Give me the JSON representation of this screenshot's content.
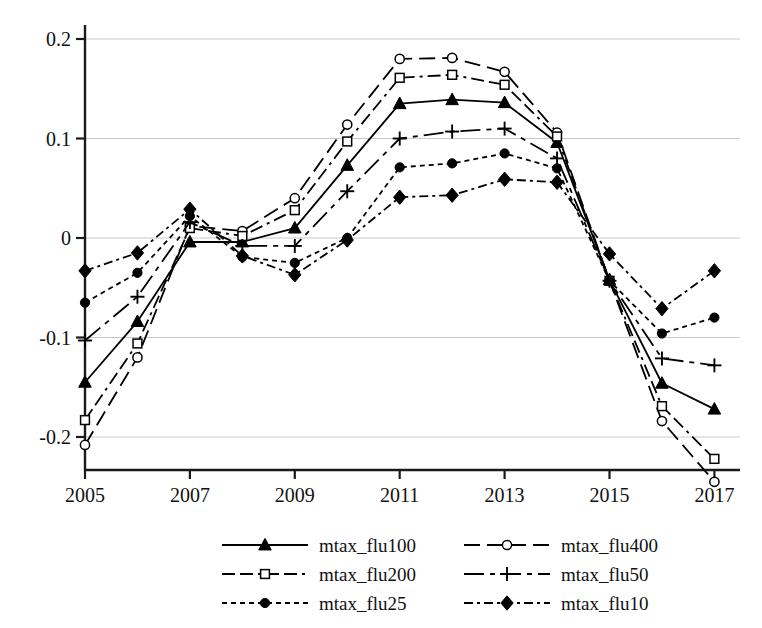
{
  "chart_data": {
    "type": "line",
    "title": "",
    "subtitle": "",
    "xlabel": "",
    "ylabel": "",
    "x": [
      2005,
      2006,
      2007,
      2008,
      2009,
      2010,
      2011,
      2012,
      2013,
      2014,
      2015,
      2016,
      2017
    ],
    "xtick_labels": [
      "2005",
      "2007",
      "2009",
      "2011",
      "2013",
      "2015",
      "2017"
    ],
    "xtick_values": [
      2005,
      2007,
      2009,
      2011,
      2013,
      2015,
      2017
    ],
    "ytick_labels": [
      "0.2",
      "0.1",
      "0",
      "-0.1",
      "-0.2"
    ],
    "ytick_values": [
      0.2,
      0.1,
      0,
      -0.1,
      -0.2
    ],
    "xlim": [
      2004.6,
      2017.4
    ],
    "ylim": [
      -0.258,
      0.212
    ],
    "grid": "horizontal",
    "legend_position": "bottom",
    "series": [
      {
        "name": "mtax_flu100",
        "marker": "triangle-filled",
        "dash": "solid",
        "color": "#000000",
        "values": [
          -0.145,
          -0.084,
          -0.004,
          -0.004,
          0.01,
          0.073,
          0.135,
          0.139,
          0.136,
          0.096,
          -0.042,
          -0.146,
          -0.172
        ]
      },
      {
        "name": "mtax_flu400",
        "marker": "circle-open",
        "dash": "long-dash",
        "color": "#000000",
        "values": [
          -0.208,
          -0.12,
          0.012,
          0.007,
          0.04,
          0.114,
          0.18,
          0.181,
          0.167,
          0.106,
          -0.043,
          -0.184,
          -0.245
        ]
      },
      {
        "name": "mtax_flu200",
        "marker": "square-open",
        "dash": "dash-dot",
        "color": "#000000",
        "values": [
          -0.183,
          -0.106,
          0.01,
          0.002,
          0.028,
          0.097,
          0.161,
          0.164,
          0.154,
          0.102,
          -0.043,
          -0.169,
          -0.222
        ]
      },
      {
        "name": "mtax_flu50",
        "marker": "plus",
        "dash": "medium-dash",
        "color": "#000000",
        "values": [
          -0.103,
          -0.059,
          0.016,
          -0.008,
          -0.008,
          0.047,
          0.1,
          0.107,
          0.11,
          0.08,
          -0.043,
          -0.121,
          -0.128
        ]
      },
      {
        "name": "mtax_flu25",
        "marker": "circle-filled",
        "dash": "short-dash",
        "color": "#000000",
        "values": [
          -0.065,
          -0.035,
          0.022,
          -0.019,
          -0.025,
          0.0,
          0.071,
          0.075,
          0.085,
          0.07,
          -0.043,
          -0.096,
          -0.08
        ]
      },
      {
        "name": "mtax_flu10",
        "marker": "diamond-filled",
        "dash": "dash-dot-short",
        "color": "#000000",
        "values": [
          -0.033,
          -0.015,
          0.029,
          -0.018,
          -0.037,
          -0.002,
          0.041,
          0.043,
          0.059,
          0.056,
          -0.016,
          -0.071,
          -0.033
        ]
      }
    ]
  },
  "legend": {
    "entries": [
      {
        "label": "mtax_flu100",
        "series_index": 0
      },
      {
        "label": "mtax_flu400",
        "series_index": 1
      },
      {
        "label": "mtax_flu200",
        "series_index": 2
      },
      {
        "label": "mtax_flu50",
        "series_index": 3
      },
      {
        "label": "mtax_flu25",
        "series_index": 4
      },
      {
        "label": "mtax_flu10",
        "series_index": 5
      }
    ]
  },
  "axis": {
    "line_color": "#1a1a1a",
    "grid_color": "#c9c9c9"
  }
}
